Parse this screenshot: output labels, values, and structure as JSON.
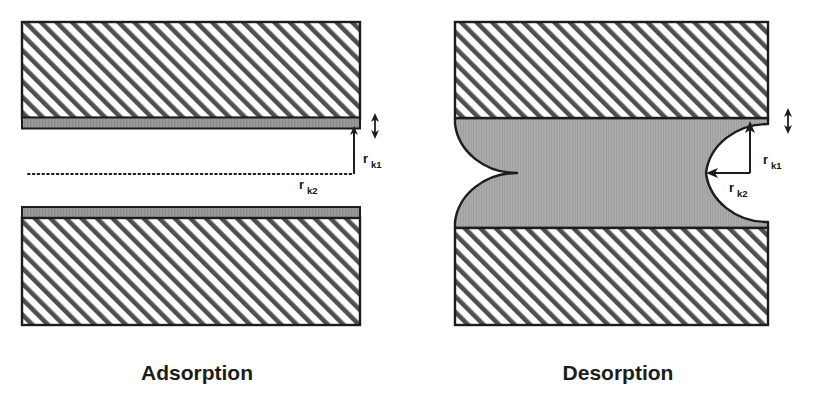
{
  "figure": {
    "background_color": "#ffffff",
    "line_color": "#1c1c1c",
    "solid_fill_color": "#ffffff",
    "hatch_color": "#4a4a4a",
    "adsorbed_layer_color": "#9a9a9a",
    "condensate_color": "#a6a6a6",
    "void_color": "#ffffff"
  },
  "panels": [
    {
      "id": "adsorption",
      "caption": "Adsorption",
      "caption_x": 197,
      "caption_y": 380,
      "state_description": "Open slit pore with thin adsorbed film on both walls",
      "top_block": {
        "name": "upper-solid-wall",
        "x": 22,
        "y": 22,
        "width": 338,
        "height": 96,
        "hatched": true
      },
      "top_adsorbed_layer": {
        "name": "upper-adsorbed-film",
        "x": 22,
        "y": 118,
        "width": 338,
        "height": 10
      },
      "bottom_adsorbed_layer": {
        "name": "lower-adsorbed-film",
        "x": 22,
        "y": 208,
        "width": 338,
        "height": 10
      },
      "bottom_block": {
        "name": "lower-solid-wall",
        "x": 22,
        "y": 218,
        "width": 338,
        "height": 107,
        "hatched": true
      },
      "pore_gap": {
        "name": "open-pore-space",
        "x": 22,
        "y": 128,
        "width": 338,
        "height": 80
      },
      "dotted_line": {
        "name": "rk2-dotted-reference-line",
        "x1": 28,
        "y1": 174,
        "x2": 355,
        "y2": 174,
        "style": "dotted"
      },
      "labels": [
        {
          "id": "rk1",
          "base": "r",
          "sub": "k1",
          "x": 363,
          "y": 163,
          "arrow": {
            "type": "vertical-double-headed",
            "x": 354,
            "y_top": 128,
            "y_bottom": 174,
            "description": "arrow from adsorbed film surface down to dotted reference line"
          }
        },
        {
          "id": "rk2",
          "base": "r",
          "sub": "k2",
          "x": 300,
          "y": 189
        }
      ],
      "thickness_marker": {
        "name": "film-thickness-double-arrow",
        "x": 375,
        "y_top": 113,
        "y_bottom": 138,
        "description": "small vertical double arrow indicating adsorbed film thickness"
      }
    },
    {
      "id": "desorption",
      "caption": "Desorption",
      "caption_x": 618,
      "caption_y": 380,
      "state_description": "Pore filled with capillary condensate; hemispherical menisci receding at both ends",
      "top_block": {
        "name": "upper-solid-wall",
        "x": 455,
        "y": 22,
        "width": 313,
        "height": 96,
        "hatched": true
      },
      "bottom_block": {
        "name": "lower-solid-wall",
        "x": 455,
        "y": 228,
        "width": 313,
        "height": 97,
        "hatched": true
      },
      "condensate": {
        "name": "capillary-condensate-body",
        "x": 455,
        "y": 118,
        "width": 313,
        "height": 110
      },
      "menisci": [
        {
          "id": "left-meniscus",
          "name": "left-meniscus-void",
          "center_x": 455,
          "center_y": 173,
          "radius_x": 62,
          "radius_y": 55,
          "opens": "left"
        },
        {
          "id": "right-meniscus",
          "name": "right-meniscus-void",
          "center_x": 768,
          "center_y": 173,
          "radius_x": 62,
          "radius_y": 55,
          "opens": "right"
        }
      ],
      "labels": [
        {
          "id": "rk1",
          "base": "r",
          "sub": "k1",
          "x": 766,
          "y": 163,
          "arrow": {
            "type": "vertical-single-headed",
            "x": 750,
            "y_from": 173,
            "y_to": 125,
            "description": "vertical radius arrow from meniscus center to top of meniscus"
          }
        },
        {
          "id": "rk2",
          "base": "r",
          "sub": "k2",
          "x": 733,
          "y": 190,
          "arrow": {
            "type": "diagonal-single-headed",
            "x_from": 750,
            "y_from": 173,
            "x_to": 710,
            "y_to": 173,
            "description": "horizontal radius arrow from meniscus center toward condensate"
          }
        }
      ],
      "thickness_marker": {
        "name": "film-thickness-double-arrow",
        "x": 786,
        "y_top": 108,
        "y_bottom": 133,
        "description": "small vertical double arrow indicating adsorbed film thickness"
      }
    }
  ],
  "symbols": {
    "rk1_full": "rk1",
    "rk2_full": "rk2",
    "rk1_meaning": "core radius perpendicular to wall",
    "rk2_meaning": "meniscus radius along pore axis"
  }
}
